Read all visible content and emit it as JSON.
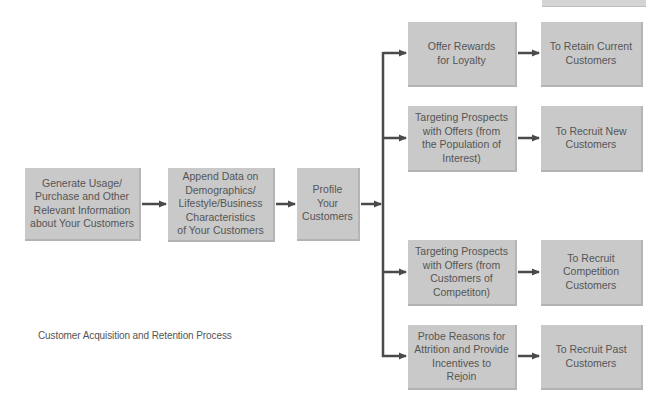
{
  "diagram": {
    "caption": "Customer Acquisition and Retention Process",
    "colors": {
      "box_fill": "#c9c9c9",
      "text": "#555555",
      "arrow": "#4a4a4a"
    },
    "main_flow": [
      {
        "id": "generate",
        "label": "Generate Usage/\nPurchase and Other\nRelevant Information\nabout Your Customers"
      },
      {
        "id": "append",
        "label": "Append Data on\nDemographics/\nLifestyle/Business\nCharacteristics\nof Your Customers"
      },
      {
        "id": "profile",
        "label": "Profile\nYour\nCustomers"
      }
    ],
    "branches": [
      {
        "action": "Offer Rewards\nfor Loyalty",
        "goal": "To Retain Current\nCustomers"
      },
      {
        "action": "Targeting Prospects\nwith Offers (from\nthe Population of\nInterest)",
        "goal": "To Recruit New\nCustomers"
      },
      {
        "action": "Targeting Prospects\nwith Offers (from\nCustomers of\nCompetiton)",
        "goal": "To Recruit\nCompetition\nCustomers"
      },
      {
        "action": "Probe Reasons for\nAttrition and Provide\nIncentives to\nRejoin",
        "goal": "To Recruit Past\nCustomers"
      }
    ]
  }
}
